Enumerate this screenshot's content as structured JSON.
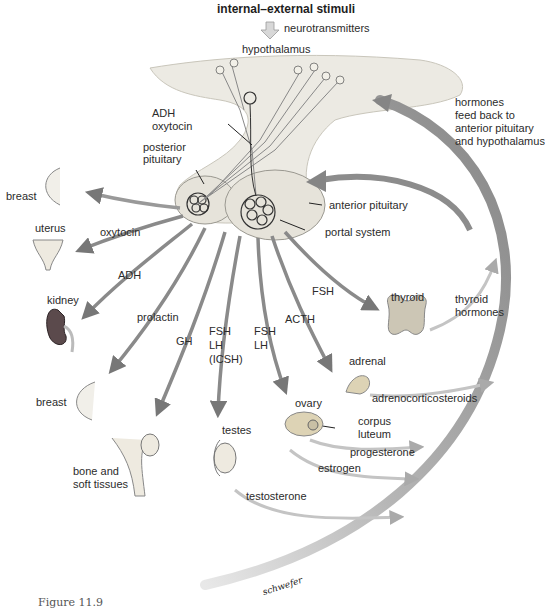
{
  "title": "internal–external stimuli",
  "caption": "Figure 11.9",
  "signature": "schwefer",
  "colors": {
    "arrow": "#8a8a8a",
    "arrow_dark": "#6e6e6e",
    "gland_fill": "#eceae3",
    "gland_edge": "#9a9890",
    "feedback_arc": "#8c8c8c",
    "organ_fill": "#d9d4c2",
    "kidney": "#5b4a4c"
  },
  "top": {
    "neurotransmitters": "neurotransmitters",
    "hypothalamus": "hypothalamus"
  },
  "pituitary": {
    "adh_oxytocin_line1": "ADH",
    "adh_oxytocin_line2": "oxytocin",
    "posterior_line1": "posterior",
    "posterior_line2": "pituitary",
    "anterior": "anterior pituitary",
    "portal": "portal system"
  },
  "feedback": {
    "line1": "hormones",
    "line2": "feed back to",
    "line3": "anterior pituitary",
    "line4": "and hypothalamus"
  },
  "hormones": {
    "oxytocin": "oxytocin",
    "adh": "ADH",
    "prolactin": "prolactin",
    "gh": "GH",
    "fsh_lh_icsh_1": "FSH",
    "fsh_lh_icsh_2": "LH",
    "fsh_lh_icsh_3": "(ICSH)",
    "fsh_lh_1": "FSH",
    "fsh_lh_2": "LH",
    "acth": "ACTH",
    "fsh_thyroid": "FSH",
    "thyroid_hormones_1": "thyroid",
    "thyroid_hormones_2": "hormones",
    "adrenocorticosteroids": "adrenocorticosteroids",
    "progesterone": "progesterone",
    "estrogen": "estrogen",
    "testosterone": "testosterone"
  },
  "organs": {
    "breast_upper": "breast",
    "uterus": "uterus",
    "kidney": "kidney",
    "breast_lower": "breast",
    "bone_1": "bone and",
    "bone_2": "soft tissues",
    "testes": "testes",
    "ovary": "ovary",
    "corpus_1": "corpus",
    "corpus_2": "luteum",
    "thyroid": "thyroid",
    "adrenal": "adrenal"
  }
}
